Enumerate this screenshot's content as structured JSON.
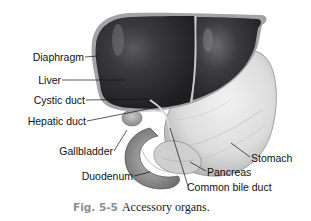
{
  "figure": {
    "caption_number": "Fig. 5-5",
    "caption_text": "Accessory organs."
  },
  "labels": {
    "diaphragm": "Diaphragm",
    "liver": "Liver",
    "cystic_duct": "Cystic duct",
    "hepatic_duct": "Hepatic duct",
    "gallbladder": "Gallbladder",
    "duodenum": "Duodenum",
    "stomach": "Stomach",
    "pancreas": "Pancreas",
    "common_bile_duct": "Common bile duct"
  },
  "colors": {
    "liver": "#2b2b2e",
    "stomach": "#d9dadb",
    "diaphragm_edge": "#9a9a9c",
    "caption_number": "#8a8f96"
  }
}
